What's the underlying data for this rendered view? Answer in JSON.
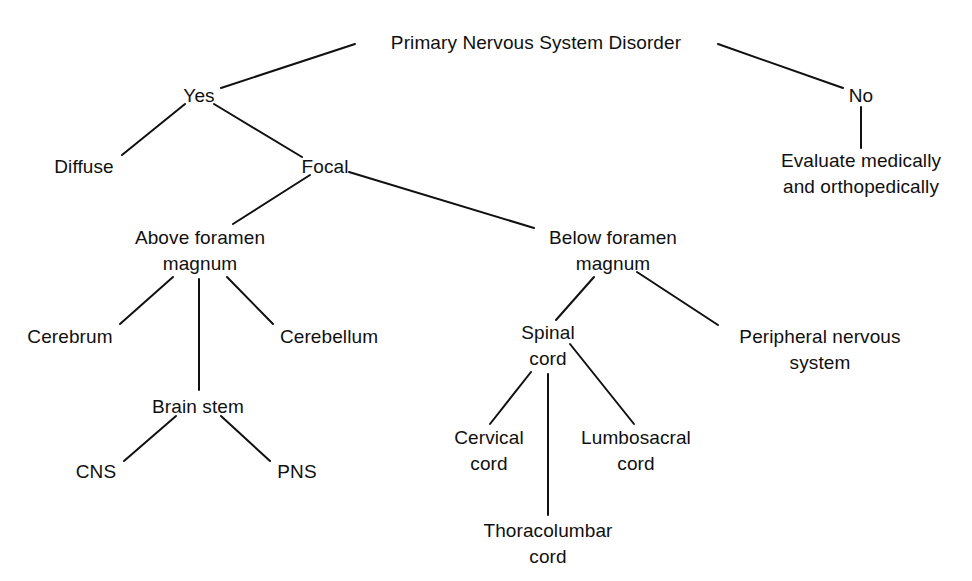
{
  "diagram": {
    "type": "decision-tree",
    "title": "Primary Nervous System Disorder",
    "orientation": "top-down",
    "colors": {
      "background": "#ffffff",
      "text": "#101010",
      "edge": "#101010"
    },
    "nodes": {
      "root": {
        "label": "Primary Nervous System Disorder",
        "cx": 536,
        "cy": 42
      },
      "yes": {
        "label": "Yes",
        "cx": 199,
        "cy": 95
      },
      "no": {
        "label": "No",
        "cx": 861,
        "cy": 95
      },
      "diffuse": {
        "label": "Diffuse",
        "cx": 84,
        "cy": 166
      },
      "focal": {
        "label": "Focal",
        "cx": 325,
        "cy": 166
      },
      "evaluate": {
        "line1": "Evaluate medically",
        "line2": "and orthopedically",
        "cx": 861,
        "cy": 167
      },
      "above_foramen": {
        "line1": "Above foramen",
        "line2": "magnum",
        "cx": 200,
        "cy": 238
      },
      "below_foramen": {
        "line1": "Below foramen",
        "line2": "magnum",
        "cx": 613,
        "cy": 238
      },
      "cerebrum": {
        "label": "Cerebrum",
        "cx": 70,
        "cy": 336
      },
      "brain_stem": {
        "label": "Brain stem",
        "cx": 198,
        "cy": 406
      },
      "cerebellum": {
        "label": "Cerebellum",
        "cx": 329,
        "cy": 336
      },
      "cns": {
        "label": "CNS",
        "cx": 96,
        "cy": 471
      },
      "pns": {
        "label": "PNS",
        "cx": 297,
        "cy": 471
      },
      "spinal_cord": {
        "line1": "Spinal",
        "line2": "cord",
        "cx": 548,
        "cy": 332
      },
      "peripheral_nervous_system": {
        "line1": "Peripheral nervous",
        "line2": "system",
        "cx": 820,
        "cy": 336
      },
      "cervical_cord": {
        "line1": "Cervical",
        "line2": "cord",
        "cx": 489,
        "cy": 437
      },
      "thoracolumbar_cord": {
        "line1": "Thoracolumbar",
        "line2": "cord",
        "cx": 548,
        "cy": 530
      },
      "lumbosacral_cord": {
        "line1": "Lumbosacral",
        "line2": "cord",
        "cx": 636,
        "cy": 437
      }
    },
    "edges": [
      {
        "from": "root",
        "to": "yes",
        "x1": 355,
        "y1": 44,
        "x2": 221,
        "y2": 88
      },
      {
        "from": "root",
        "to": "no",
        "x1": 718,
        "y1": 44,
        "x2": 843,
        "y2": 88
      },
      {
        "from": "yes",
        "to": "diffuse",
        "x1": 185,
        "y1": 104,
        "x2": 122,
        "y2": 155
      },
      {
        "from": "yes",
        "to": "focal",
        "x1": 214,
        "y1": 104,
        "x2": 302,
        "y2": 157
      },
      {
        "from": "no",
        "to": "evaluate",
        "x1": 861,
        "y1": 107,
        "x2": 861,
        "y2": 148
      },
      {
        "from": "focal",
        "to": "above_foramen",
        "x1": 310,
        "y1": 175,
        "x2": 233,
        "y2": 224
      },
      {
        "from": "focal",
        "to": "below_foramen",
        "x1": 349,
        "y1": 172,
        "x2": 534,
        "y2": 228
      },
      {
        "from": "above_foramen",
        "to": "cerebrum",
        "x1": 173,
        "y1": 277,
        "x2": 120,
        "y2": 324
      },
      {
        "from": "above_foramen",
        "to": "brain_stem",
        "x1": 199,
        "y1": 279,
        "x2": 199,
        "y2": 390
      },
      {
        "from": "above_foramen",
        "to": "cerebellum",
        "x1": 227,
        "y1": 277,
        "x2": 273,
        "y2": 324
      },
      {
        "from": "brain_stem",
        "to": "cns",
        "x1": 176,
        "y1": 416,
        "x2": 124,
        "y2": 461
      },
      {
        "from": "brain_stem",
        "to": "pns",
        "x1": 221,
        "y1": 416,
        "x2": 270,
        "y2": 461
      },
      {
        "from": "below_foramen",
        "to": "spinal_cord",
        "x1": 594,
        "y1": 277,
        "x2": 556,
        "y2": 320
      },
      {
        "from": "below_foramen",
        "to": "peripheral_nervous_system",
        "x1": 637,
        "y1": 272,
        "x2": 718,
        "y2": 325
      },
      {
        "from": "spinal_cord",
        "to": "cervical_cord",
        "x1": 531,
        "y1": 372,
        "x2": 490,
        "y2": 424
      },
      {
        "from": "spinal_cord",
        "to": "thoracolumbar_cord",
        "x1": 548,
        "y1": 374,
        "x2": 548,
        "y2": 515
      },
      {
        "from": "spinal_cord",
        "to": "lumbosacral_cord",
        "x1": 570,
        "y1": 344,
        "x2": 634,
        "y2": 424
      }
    ]
  }
}
